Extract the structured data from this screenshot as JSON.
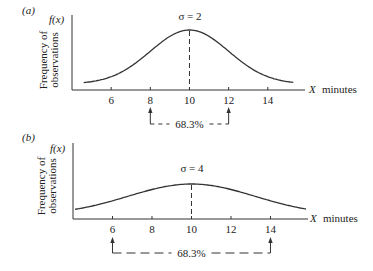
{
  "chart_data": [
    {
      "type": "line",
      "panel_label": "(a)",
      "title": "σ = 2",
      "ylabel_short": "f(x)",
      "ylabel_lines": [
        "Frequency of",
        "observations"
      ],
      "xlabel_var": "X",
      "xlabel_unit": "minutes",
      "mean": 10,
      "sigma": 2,
      "xlim": [
        4.0,
        15.9
      ],
      "x_ticks": [
        6,
        8,
        10,
        12,
        14
      ],
      "tick_labels": [
        "6",
        "8",
        "10",
        "12",
        "14"
      ],
      "curve_range": [
        4.6,
        15.3
      ],
      "bracket": {
        "from": 8,
        "to": 12,
        "label": "68.3%"
      },
      "grid": false
    },
    {
      "type": "line",
      "panel_label": "(b)",
      "title": "σ = 4",
      "ylabel_short": "f(x)",
      "ylabel_lines": [
        "Frequency of",
        "observations"
      ],
      "xlabel_var": "X",
      "xlabel_unit": "minutes",
      "mean": 10,
      "sigma": 4,
      "xlim": [
        4.0,
        15.9
      ],
      "x_ticks": [
        6,
        8,
        10,
        12,
        14
      ],
      "tick_labels": [
        "6",
        "8",
        "10",
        "12",
        "14"
      ],
      "curve_range": [
        4.1,
        15.8
      ],
      "bracket": {
        "from": 6,
        "to": 14,
        "label": "68.3%"
      },
      "grid": false
    }
  ]
}
